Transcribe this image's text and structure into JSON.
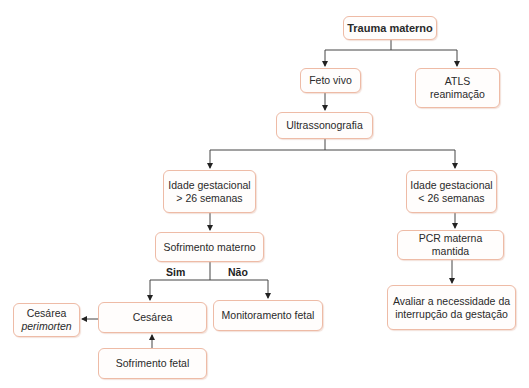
{
  "diagram": {
    "colors": {
      "node_border": "#eebba6",
      "line": "#333333"
    },
    "nodes": {
      "trauma": "Trauma materno",
      "feto_vivo": "Feto vivo",
      "atls": "ATLS\nreanimação",
      "ultrassom": "Ultrassonografia",
      "ig_maior": "Idade gestacional\n> 26 semanas",
      "ig_menor": "Idade gestacional\n< 26 semanas",
      "sofr_materno": "Sofrimento materno",
      "pcr": "PCR materna mantida",
      "cesarea": "Cesárea",
      "perimorten_line1": "Cesárea",
      "perimorten_line2": "perimorten",
      "monitoramento": "Monitoramento fetal",
      "sofr_fetal": "Sofrimento fetal",
      "avaliar": "Avaliar a necessidade da\ninterrupção da gestação"
    },
    "edge_labels": {
      "sim": "Sim",
      "nao": "Não"
    }
  }
}
